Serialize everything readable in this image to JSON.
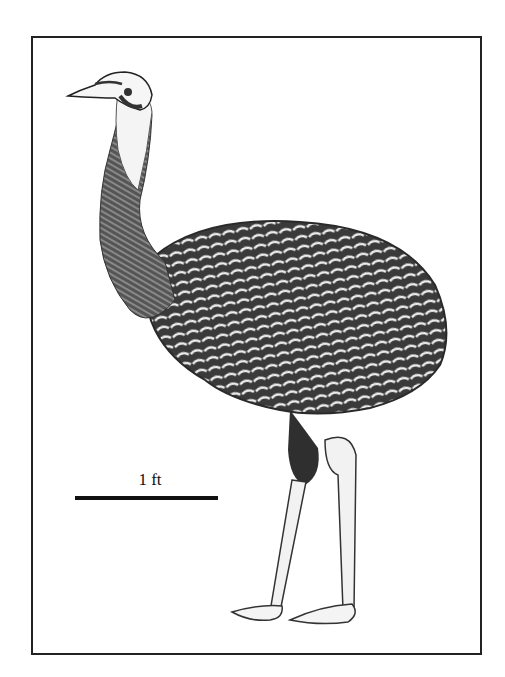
{
  "figure": {
    "scale_bar": {
      "label": "1 ft"
    },
    "colors": {
      "ink": "#222222",
      "paper": "#ffffff",
      "feather_dark": "#3a3a3a",
      "feather_light": "#e8e8e8"
    }
  }
}
